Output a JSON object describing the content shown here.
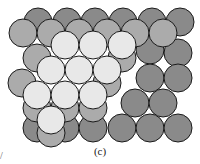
{
  "figure": {
    "caption": "(c)",
    "stray_mark": "/",
    "colors": {
      "dark": "#8a8a8a",
      "medium": "#ababab",
      "light": "#e8e8e8",
      "outline": "#1a1a1a"
    },
    "radius": 14,
    "layers": [
      {
        "name": "bottom-layer-dark",
        "shade": "dark",
        "centers": [
          [
            38,
            22
          ],
          [
            67,
            22
          ],
          [
            95,
            22
          ],
          [
            123,
            22
          ],
          [
            152,
            22
          ],
          [
            180,
            22
          ],
          [
            150,
            50
          ],
          [
            178,
            53
          ],
          [
            150,
            78
          ],
          [
            178,
            78
          ],
          [
            135,
            103
          ],
          [
            163,
            103
          ],
          [
            122,
            128
          ],
          [
            150,
            128
          ],
          [
            178,
            128
          ],
          [
            37,
            128
          ],
          [
            65,
            128
          ],
          [
            93,
            128
          ]
        ]
      },
      {
        "name": "middle-layer-medium",
        "shade": "medium",
        "centers": [
          [
            23,
            33
          ],
          [
            51,
            33
          ],
          [
            79,
            33
          ],
          [
            107,
            33
          ],
          [
            135,
            33
          ],
          [
            163,
            33
          ],
          [
            37,
            58
          ],
          [
            122,
            58
          ],
          [
            22,
            83
          ],
          [
            107,
            83
          ],
          [
            37,
            108
          ],
          [
            65,
            108
          ],
          [
            93,
            108
          ],
          [
            51,
            133
          ]
        ]
      },
      {
        "name": "top-layer-light",
        "shade": "light",
        "centers": [
          [
            65,
            45
          ],
          [
            93,
            45
          ],
          [
            122,
            45
          ],
          [
            51,
            70
          ],
          [
            79,
            70
          ],
          [
            107,
            70
          ],
          [
            37,
            95
          ],
          [
            65,
            95
          ],
          [
            93,
            95
          ],
          [
            51,
            120
          ]
        ]
      }
    ]
  }
}
